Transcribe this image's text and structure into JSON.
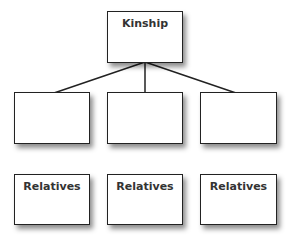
{
  "diagram": {
    "title": "Kinship",
    "root": {
      "label": "Kinship"
    },
    "middle_row": [
      {
        "label": ""
      },
      {
        "label": ""
      },
      {
        "label": ""
      }
    ],
    "bottom_row": [
      {
        "label": "Relatives"
      },
      {
        "label": "Relatives"
      },
      {
        "label": "Relatives"
      }
    ],
    "colors": {
      "border": "#222222",
      "text": "#333333",
      "background": "#ffffff"
    }
  }
}
